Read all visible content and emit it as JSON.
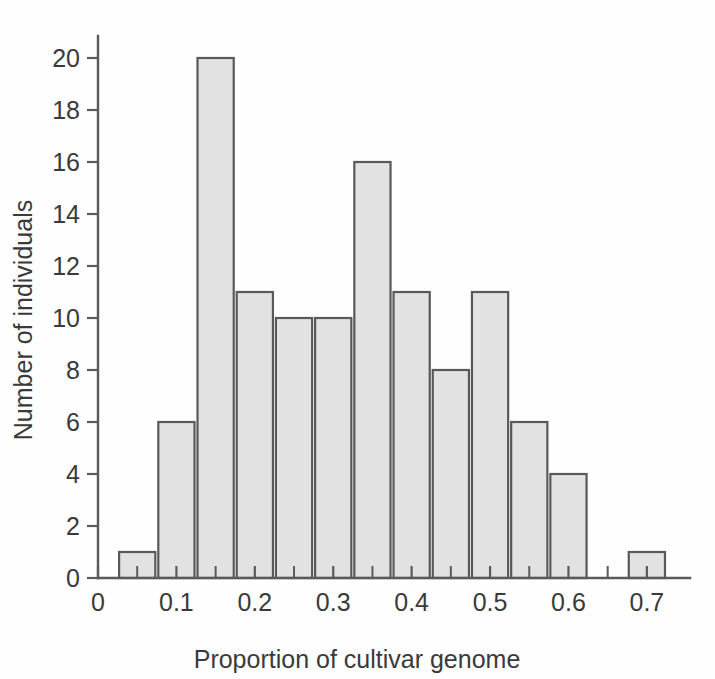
{
  "chart_data": {
    "type": "bar",
    "title": "",
    "subtitle": "",
    "xlabel": "Proportion of cultivar genome",
    "ylabel": "Number of individuals",
    "categories": [
      "0.05",
      "0.10",
      "0.15",
      "0.20",
      "0.25",
      "0.30",
      "0.35",
      "0.40",
      "0.45",
      "0.50",
      "0.55",
      "0.60",
      "0.65",
      "0.70"
    ],
    "values": [
      1,
      6,
      20,
      11,
      10,
      10,
      16,
      11,
      8,
      11,
      6,
      4,
      0,
      1
    ],
    "bin_width": 0.05,
    "bin_edges": [
      0.025,
      0.075,
      0.125,
      0.175,
      0.225,
      0.275,
      0.325,
      0.375,
      0.425,
      0.475,
      0.525,
      0.575,
      0.625,
      0.675,
      0.725
    ],
    "xlim": [
      0.0,
      0.755
    ],
    "ylim": [
      0,
      20
    ],
    "x_tick_labels": [
      "0",
      "0.1",
      "0.2",
      "0.3",
      "0.4",
      "0.5",
      "0.6",
      "0.7"
    ],
    "x_tick_values": [
      0,
      0.1,
      0.2,
      0.3,
      0.4,
      0.5,
      0.6,
      0.7
    ],
    "x_minor_tick_values": [
      0.05,
      0.15,
      0.25,
      0.35,
      0.45,
      0.55,
      0.65
    ],
    "y_tick_labels": [
      "0",
      "2",
      "4",
      "6",
      "8",
      "10",
      "12",
      "14",
      "16",
      "18",
      "20"
    ],
    "y_tick_values": [
      0,
      2,
      4,
      6,
      8,
      10,
      12,
      14,
      16,
      18,
      20
    ],
    "grid": false,
    "legend": null,
    "legend_position": "none",
    "annotations": [],
    "colors": {
      "bar_fill": "#e2e2e2",
      "bar_stroke": "#595959",
      "axis": "#5a5a5a",
      "text": "#3a3a3a",
      "background": "#fefefe"
    }
  }
}
